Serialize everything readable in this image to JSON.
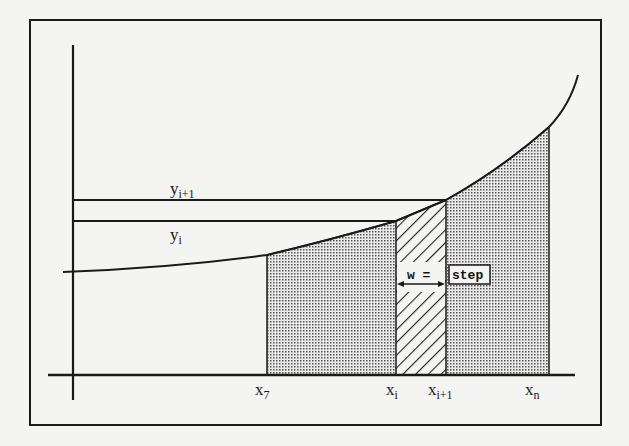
{
  "diagram": {
    "labels": {
      "y_upper": {
        "base": "y",
        "sub": "i+1"
      },
      "y_lower": {
        "base": "y",
        "sub": "i"
      },
      "x_start": {
        "base": "x",
        "sub": "7"
      },
      "x_i": {
        "base": "x",
        "sub": "i"
      },
      "x_i1": {
        "base": "x",
        "sub": "i+1"
      },
      "x_n": {
        "base": "x",
        "sub": "n"
      },
      "width_label": "w =",
      "width_value": "step"
    },
    "colors": {
      "ink": "#1a1a1a",
      "background": "#f4f4f2",
      "dot_fill": "#bdbdbd"
    }
  }
}
